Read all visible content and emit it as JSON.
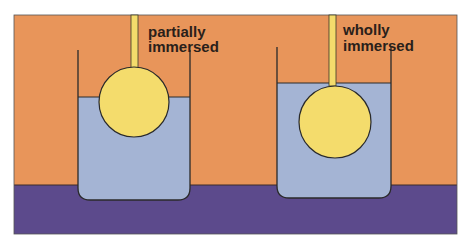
{
  "diagram": {
    "colors": {
      "background": "#e8955a",
      "base": "#5c4a8c",
      "water": "#a4b4d4",
      "ball": "#f4dc6c",
      "outline": "#2a2a2a"
    },
    "beakers": [
      {
        "label_line1": "partially",
        "label_line2": "immersed",
        "state": "partially immersed"
      },
      {
        "label_line1": "wholly",
        "label_line2": "immersed",
        "state": "wholly immersed"
      }
    ]
  }
}
